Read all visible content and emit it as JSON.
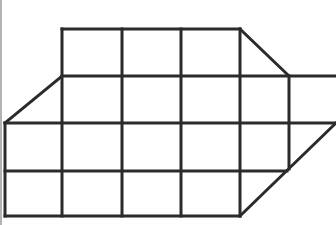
{
  "diagram": {
    "type": "grid-figure",
    "stroke_color": "#2b2b2b",
    "border_color": "#9a9a9a",
    "background": "#ffffff",
    "grid": {
      "columns_x": [
        5,
        62,
        122,
        181,
        240,
        289,
        336
      ],
      "rows_y": [
        29,
        76,
        123,
        171,
        216
      ]
    },
    "horizontal_lines": [
      {
        "y": 29,
        "x1": 62,
        "x2": 240
      },
      {
        "y": 76,
        "x1": 62,
        "x2": 336
      },
      {
        "y": 123,
        "x1": 5,
        "x2": 336
      },
      {
        "y": 171,
        "x1": 5,
        "x2": 287
      },
      {
        "y": 216,
        "x1": 5,
        "x2": 240
      }
    ],
    "vertical_lines": [
      {
        "x": 5,
        "y1": 123,
        "y2": 216
      },
      {
        "x": 62,
        "y1": 29,
        "y2": 216
      },
      {
        "x": 122,
        "y1": 29,
        "y2": 216
      },
      {
        "x": 181,
        "y1": 29,
        "y2": 216
      },
      {
        "x": 240,
        "y1": 29,
        "y2": 216
      },
      {
        "x": 289,
        "y1": 76,
        "y2": 169
      }
    ],
    "diagonal_lines": [
      {
        "x1": 240,
        "y1": 29,
        "x2": 289,
        "y2": 76
      },
      {
        "x1": 62,
        "y1": 76,
        "x2": 5,
        "y2": 123
      },
      {
        "x1": 336,
        "y1": 123,
        "x2": 240,
        "y2": 216
      }
    ],
    "left_border": {
      "x": 1,
      "y1": 0,
      "y2": 225
    }
  }
}
